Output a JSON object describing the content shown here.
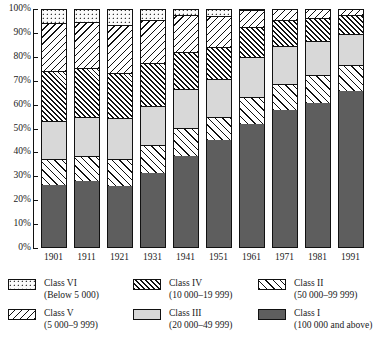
{
  "chart_data": {
    "type": "bar",
    "stacked": true,
    "stack_total": 100,
    "title": "",
    "subtitle": "",
    "xlabel": "",
    "ylabel": "",
    "ylim": [
      0,
      100
    ],
    "grid": false,
    "legend_position": "bottom",
    "categories": [
      "1901",
      "1911",
      "1921",
      "1931",
      "1941",
      "1951",
      "1961",
      "1971",
      "1981",
      "1991"
    ],
    "y_ticks": [
      "0%",
      "10%",
      "20%",
      "30%",
      "40%",
      "50%",
      "60%",
      "70%",
      "80%",
      "90%",
      "100%"
    ],
    "y_tick_values": [
      0,
      10,
      20,
      30,
      40,
      50,
      60,
      70,
      80,
      90,
      100
    ],
    "series": [
      {
        "name": "Class I",
        "range": "100 000 and above",
        "pattern": "solid-dark-grey",
        "color": "#5e5e5e",
        "values": [
          26.0,
          27.5,
          25.5,
          31.0,
          38.2,
          44.6,
          51.4,
          57.2,
          60.4,
          65.2
        ]
      },
      {
        "name": "Class II",
        "range": "50 000–99 999",
        "pattern": "diagonal-forward-wide",
        "color": "#ffffff",
        "values": [
          11.0,
          10.5,
          11.5,
          11.5,
          11.4,
          9.9,
          11.2,
          10.9,
          11.6,
          10.9
        ]
      },
      {
        "name": "Class III",
        "range": "20 000–49 999",
        "pattern": "stipple-grey",
        "color": "#d8d8d8",
        "values": [
          15.6,
          16.5,
          16.9,
          16.5,
          16.4,
          15.7,
          16.8,
          16.0,
          14.3,
          13.2
        ]
      },
      {
        "name": "Class IV",
        "range": "10 000–19 999",
        "pattern": "diagonal-forward-dense",
        "color": "#ffffff",
        "values": [
          20.9,
          20.3,
          19.0,
          18.0,
          15.8,
          13.6,
          12.7,
          10.9,
          9.5,
          7.8
        ]
      },
      {
        "name": "Class V",
        "range": "5 000–9 999",
        "pattern": "diagonal-back",
        "color": "#ffffff",
        "values": [
          20.2,
          19.3,
          20.1,
          18.2,
          15.1,
          13.0,
          6.9,
          4.4,
          3.6,
          2.6
        ]
      },
      {
        "name": "Class VI",
        "range": "Below 5 000",
        "pattern": "open-dot",
        "color": "#fbfbfb",
        "values": [
          6.3,
          5.9,
          7.0,
          4.8,
          3.1,
          3.2,
          1.0,
          0.6,
          0.6,
          0.3
        ]
      }
    ]
  },
  "legend": {
    "columns": [
      [
        {
          "class_name": "Class VI",
          "range_label": "(Below 5 000)",
          "swatch": "class-vi-swatch"
        },
        {
          "class_name": "Class V",
          "range_label": "(5 000–9 999)",
          "swatch": "class-v-swatch"
        }
      ],
      [
        {
          "class_name": "Class IV",
          "range_label": "(10 000–19 999)",
          "swatch": "class-iv-swatch"
        },
        {
          "class_name": "Class III",
          "range_label": "(20 000–49 999)",
          "swatch": "class-iii-swatch"
        }
      ],
      [
        {
          "class_name": "Class II",
          "range_label": "(50 000–99 999)",
          "swatch": "class-ii-swatch"
        },
        {
          "class_name": "Class I",
          "range_label": "(100 000 and above)",
          "swatch": "class-i-swatch"
        }
      ]
    ]
  }
}
